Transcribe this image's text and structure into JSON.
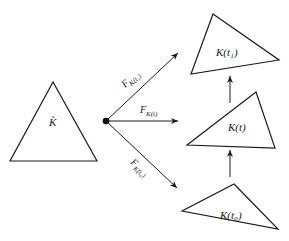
{
  "diagram": {
    "reference_element": {
      "label": "K̂",
      "vertices": [
        [
          53,
          82
        ],
        [
          10,
          161
        ],
        [
          97,
          161
        ]
      ]
    },
    "origin_point": {
      "x": 106,
      "y": 121
    },
    "maps": [
      {
        "id": "map-t1",
        "label_main": "F",
        "label_sub": "K(t₁)",
        "from": [
          106,
          121
        ],
        "to": [
          178,
          53
        ]
      },
      {
        "id": "map-t",
        "label_main": "F",
        "label_sub": "K(t)",
        "from": [
          106,
          121
        ],
        "to": [
          178,
          121
        ]
      },
      {
        "id": "map-t0",
        "label_main": "F",
        "label_sub": "K(t₀)",
        "from": [
          106,
          121
        ],
        "to": [
          177,
          188
        ]
      }
    ],
    "elements": [
      {
        "id": "K-t1",
        "label": "K(t₁)",
        "vertices": [
          [
            213,
            14
          ],
          [
            279,
            60
          ],
          [
            191,
            74
          ]
        ]
      },
      {
        "id": "K-t",
        "label": "K(t)",
        "vertices": [
          [
            256,
            92
          ],
          [
            275,
            148
          ],
          [
            187,
            145
          ]
        ]
      },
      {
        "id": "K-t0",
        "label": "K(t₀)",
        "vertices": [
          [
            234,
            184
          ],
          [
            278,
            229
          ],
          [
            182,
            211
          ]
        ]
      }
    ],
    "time_arrows": [
      {
        "from": [
          230,
          103
        ],
        "to": [
          230,
          76
        ]
      },
      {
        "from": [
          230,
          177
        ],
        "to": [
          230,
          150
        ]
      }
    ],
    "colors": {
      "stroke": "#1a1a1a",
      "background": "#ffffff"
    }
  }
}
